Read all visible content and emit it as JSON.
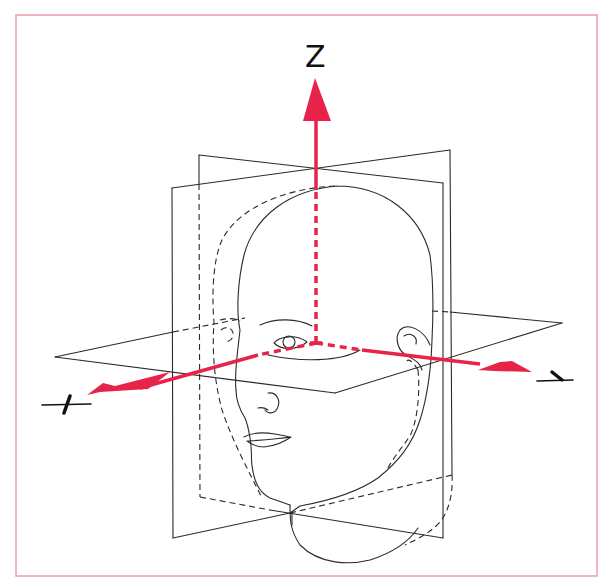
{
  "figure": {
    "frame_color": "#e8a0a8",
    "axis_color": "#e8234a",
    "line_color": "#2a2a2a"
  },
  "axes": {
    "z": {
      "label": "Z"
    },
    "x": {
      "label": "X"
    },
    "y": {
      "label": "Y"
    }
  },
  "planes": [
    {
      "name": "frontal-plane"
    },
    {
      "name": "sagittal-plane"
    },
    {
      "name": "horizontal-plane"
    }
  ]
}
